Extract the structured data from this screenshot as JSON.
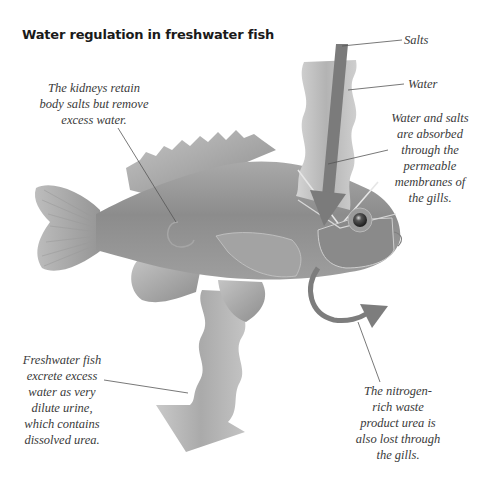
{
  "diagram": {
    "title": "Water regulation in freshwater fish",
    "labels": {
      "salts": "Salts",
      "water": "Water"
    },
    "callouts": {
      "kidneys": [
        "The kidneys retain",
        "body salts but remove",
        "excess water."
      ],
      "gills_absorb": [
        "Water and salts",
        "are absorbed",
        "through the",
        "permeable",
        "membranes of",
        "the gills."
      ],
      "urine": [
        "Freshwater fish",
        "excrete excess",
        "water as very",
        "dilute urine,",
        "which contains",
        "dissolved urea."
      ],
      "urea": [
        "The nitrogen-",
        "rich waste",
        "product urea is",
        "also lost through",
        "the gills."
      ]
    },
    "colors": {
      "fish_body": "#8f8f8f",
      "fish_fin": "#a8a8a8",
      "salts_arrow": "#7a7a7a",
      "water_band": "#bdbdbd",
      "leader_line": "#555555",
      "text": "#3a3a3a"
    }
  }
}
